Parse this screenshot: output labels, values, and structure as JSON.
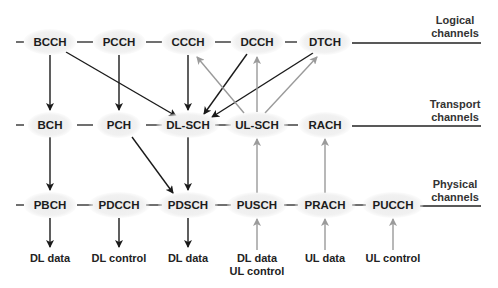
{
  "layers": {
    "logical": {
      "line1": "Logical",
      "line2": "channels"
    },
    "transport": {
      "line1": "Transport",
      "line2": "channels"
    },
    "physical": {
      "line1": "Physical",
      "line2": "channels"
    }
  },
  "logical_channels": [
    "BCCH",
    "PCCH",
    "CCCH",
    "DCCH",
    "DTCH"
  ],
  "transport_channels": [
    "BCH",
    "PCH",
    "DL-SCH",
    "UL-SCH",
    "RACH"
  ],
  "physical_channels": [
    "PBCH",
    "PDCCH",
    "PDSCH",
    "PUSCH",
    "PRACH",
    "PUCCH"
  ],
  "outputs": {
    "pbch": "DL data",
    "pdcch": "DL control",
    "pdsch": "DL data",
    "pusch_1": "DL data",
    "pusch_2": "UL control",
    "prach": "UL data",
    "pucch": "UL control"
  },
  "colors": {
    "downlink": "#1a1a1a",
    "uplink": "#9a9a9a",
    "node_bg": "#eeeeee"
  }
}
